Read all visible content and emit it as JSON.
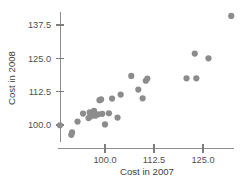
{
  "chart_data": {
    "type": "scatter",
    "title": "",
    "xlabel": "Cost in 2007",
    "ylabel": "Cost in 2008",
    "xticks": [
      "100.0",
      "112.5",
      "125.0"
    ],
    "xtick_values": [
      100.0,
      112.5,
      125.0
    ],
    "yticks": [
      "100.0",
      "112.5",
      "125.0",
      "137.5"
    ],
    "ytick_values": [
      100.0,
      112.5,
      125.0,
      137.5
    ],
    "xlim": [
      88.0,
      134.0
    ],
    "ylim": [
      94.0,
      142.5
    ],
    "grid": false,
    "legend": null,
    "marker": {
      "shape": "circle",
      "color": "#8c8c8c",
      "size": 3.1
    },
    "axis_color": "#8c8c8c",
    "points": [
      {
        "x": 88.5,
        "y": 99.9
      },
      {
        "x": 91.4,
        "y": 96.3
      },
      {
        "x": 91.6,
        "y": 97.2
      },
      {
        "x": 93.0,
        "y": 101.3
      },
      {
        "x": 94.4,
        "y": 104.3
      },
      {
        "x": 95.8,
        "y": 102.6
      },
      {
        "x": 96.1,
        "y": 104.7
      },
      {
        "x": 96.3,
        "y": 103.2
      },
      {
        "x": 97.2,
        "y": 105.3
      },
      {
        "x": 97.5,
        "y": 103.5
      },
      {
        "x": 98.3,
        "y": 104.0
      },
      {
        "x": 98.6,
        "y": 109.3
      },
      {
        "x": 99.0,
        "y": 109.6
      },
      {
        "x": 99.3,
        "y": 104.2
      },
      {
        "x": 100.0,
        "y": 100.2
      },
      {
        "x": 101.0,
        "y": 104.4
      },
      {
        "x": 101.8,
        "y": 109.9
      },
      {
        "x": 103.2,
        "y": 102.8
      },
      {
        "x": 104.0,
        "y": 111.4
      },
      {
        "x": 106.7,
        "y": 118.4
      },
      {
        "x": 108.5,
        "y": 113.3
      },
      {
        "x": 109.6,
        "y": 110.0
      },
      {
        "x": 110.4,
        "y": 116.6
      },
      {
        "x": 110.8,
        "y": 117.4
      },
      {
        "x": 120.8,
        "y": 117.5
      },
      {
        "x": 123.3,
        "y": 117.5
      },
      {
        "x": 122.9,
        "y": 126.8
      },
      {
        "x": 126.4,
        "y": 125.0
      },
      {
        "x": 132.2,
        "y": 140.9
      }
    ]
  }
}
